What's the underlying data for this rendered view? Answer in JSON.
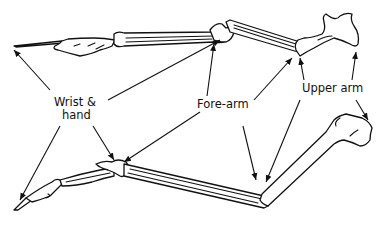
{
  "diagram": {
    "type": "anatomical-comparison",
    "labels": {
      "wrist_hand_line1": "Wrist &",
      "wrist_hand_line2": "hand",
      "forearm": "Fore-arm",
      "upper_arm": "Upper arm"
    },
    "colors": {
      "ink": "#111111",
      "background": "#ffffff"
    }
  }
}
